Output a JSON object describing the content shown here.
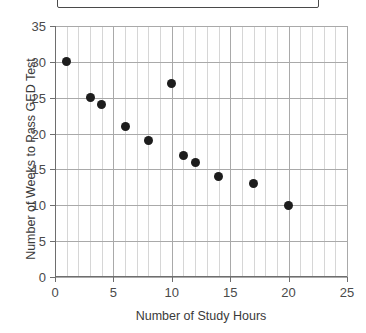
{
  "title_box": {
    "text": "",
    "visible": true,
    "border_color": "#4a4a4a"
  },
  "chart_data": {
    "type": "scatter",
    "title": "",
    "xlabel": "Number of Study Hours",
    "ylabel": "Number of Weeks to Pass GED Test",
    "xlim": [
      0,
      25
    ],
    "ylim": [
      0,
      35
    ],
    "xticks": [
      0,
      5,
      10,
      15,
      20,
      25
    ],
    "yticks": [
      0,
      5,
      10,
      15,
      20,
      25,
      30,
      35
    ],
    "xtick_labels": [
      "0",
      "5",
      "10",
      "15",
      "20",
      "25"
    ],
    "ytick_labels": [
      "0",
      "5",
      "10",
      "15",
      "20",
      "25",
      "30",
      "35"
    ],
    "grid": {
      "vertical_minor_step": 1,
      "vertical_major_step": 5,
      "horizontal_step": 5,
      "minor_color": "#d6d6d6",
      "major_color": "#a9a9a9"
    },
    "legend": null,
    "marker": {
      "shape": "circle",
      "color": "#1d1d1d",
      "size_px": 9
    },
    "x": [
      1,
      3,
      4,
      6,
      8,
      10,
      11,
      12,
      14,
      17,
      20
    ],
    "y": [
      30,
      25,
      24,
      21,
      19,
      27,
      17,
      16,
      14,
      13,
      10
    ],
    "points": [
      {
        "x": 1,
        "y": 30
      },
      {
        "x": 3,
        "y": 25
      },
      {
        "x": 4,
        "y": 24
      },
      {
        "x": 6,
        "y": 21
      },
      {
        "x": 8,
        "y": 19
      },
      {
        "x": 10,
        "y": 27
      },
      {
        "x": 11,
        "y": 17
      },
      {
        "x": 12,
        "y": 16
      },
      {
        "x": 14,
        "y": 14
      },
      {
        "x": 17,
        "y": 13
      },
      {
        "x": 20,
        "y": 10
      }
    ]
  }
}
